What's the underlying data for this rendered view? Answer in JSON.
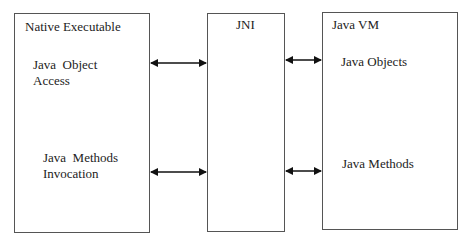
{
  "boxes": {
    "native": {
      "title": "Native Executable",
      "item1_line1": "Java  Object",
      "item1_line2": "Access",
      "item2_line1": "Java  Methods",
      "item2_line2": "Invocation"
    },
    "jni": {
      "title": "JNI"
    },
    "jvm": {
      "title": "Java VM",
      "item1": "Java Objects",
      "item2": "Java Methods"
    }
  },
  "arrows": [
    {
      "from": "Native Executable",
      "to": "JNI",
      "type": "bidirectional",
      "row": "object access"
    },
    {
      "from": "JNI",
      "to": "Java VM",
      "type": "bidirectional",
      "row": "objects"
    },
    {
      "from": "Native Executable",
      "to": "JNI",
      "type": "bidirectional",
      "row": "methods invocation"
    },
    {
      "from": "JNI",
      "to": "Java VM",
      "type": "bidirectional",
      "row": "methods"
    }
  ]
}
